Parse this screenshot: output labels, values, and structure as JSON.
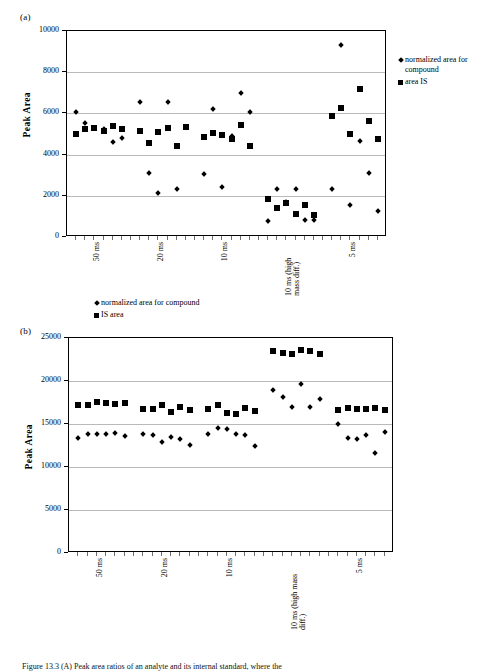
{
  "figure": {
    "caption": "Figure 13.3   (A) Peak area ratios of an analyte and its internal standard, where the"
  },
  "panel_a": {
    "label": "(a)",
    "legend": [
      {
        "marker": "diamond",
        "text": "normalized area for compound"
      },
      {
        "marker": "square",
        "text": "area IS"
      }
    ]
  },
  "panel_b": {
    "label": "(b)",
    "legend": [
      {
        "marker": "diamond",
        "text": "normalized area for compound"
      },
      {
        "marker": "square",
        "text": "IS area"
      }
    ]
  },
  "chart_data": [
    {
      "type": "scatter",
      "panel": "(a)",
      "title": "",
      "xlabel": "",
      "ylabel": "Peak Area",
      "ylim": [
        0,
        10000
      ],
      "yticks": [
        0,
        2000,
        4000,
        6000,
        8000,
        10000
      ],
      "ytick_labels": [
        "0",
        "2000",
        "4000",
        "6000",
        "8000",
        "10000"
      ],
      "grid": true,
      "legend_position": "right",
      "group_labels": [
        "50 ms",
        "20 ms",
        "10 ms",
        "10 ms (high mass diff.)",
        "5 ms"
      ],
      "group_size": 6,
      "x": [
        1,
        2,
        3,
        4,
        5,
        6,
        8,
        9,
        10,
        11,
        12,
        13,
        15,
        16,
        17,
        18,
        19,
        20,
        22,
        23,
        24,
        25,
        26,
        27,
        29,
        30,
        31,
        32,
        33,
        34
      ],
      "xlim": [
        0,
        35
      ],
      "series": [
        {
          "name": "normalized area for compound",
          "marker": "diamond",
          "values": [
            6050,
            5550,
            5300,
            5250,
            4630,
            4800,
            6570,
            3120,
            2130,
            6550,
            2320,
            5350,
            3080,
            6230,
            2420,
            4900,
            7000,
            6080,
            790,
            2320,
            1700,
            2320,
            820,
            820,
            2320,
            9300,
            1550,
            4650,
            3090,
            1260
          ]
        },
        {
          "name": "area IS",
          "marker": "square",
          "values": [
            5000,
            5230,
            5270,
            5160,
            5400,
            5220,
            5140,
            4580,
            5080,
            5270,
            4440,
            5350,
            4860,
            5050,
            4960,
            4780,
            5460,
            4430,
            1830,
            1390,
            1640,
            1100,
            1540,
            1090,
            5880,
            6250,
            5000,
            7200,
            5650,
            4760
          ]
        }
      ]
    },
    {
      "type": "scatter",
      "panel": "(b)",
      "title": "",
      "xlabel": "",
      "ylabel": "Peak Area",
      "ylim": [
        0,
        25000
      ],
      "yticks": [
        0,
        5000,
        10000,
        15000,
        20000,
        25000
      ],
      "ytick_labels": [
        "0",
        "5000",
        "10000",
        "15000",
        "20000",
        "25000"
      ],
      "grid": true,
      "legend_position": "top",
      "group_labels": [
        "50 ms",
        "20 ms",
        "10 ms",
        "10 ms (high mass diff.)",
        "5 ms"
      ],
      "group_size": 6,
      "x": [
        1,
        2,
        3,
        4,
        5,
        6,
        8,
        9,
        10,
        11,
        12,
        13,
        15,
        16,
        17,
        18,
        19,
        20,
        22,
        23,
        24,
        25,
        26,
        27,
        29,
        30,
        31,
        32,
        33,
        34
      ],
      "xlim": [
        0,
        35
      ],
      "series": [
        {
          "name": "normalized area for compound",
          "marker": "diamond",
          "values": [
            13400,
            13850,
            13820,
            13880,
            13900,
            13600,
            13850,
            13720,
            12900,
            13450,
            13300,
            12600,
            13800,
            14500,
            14430,
            13850,
            13700,
            12450,
            18900,
            18100,
            17000,
            19700,
            17000,
            17900,
            14950,
            13400,
            13250,
            13750,
            11650,
            14050
          ]
        },
        {
          "name": "IS area",
          "marker": "square",
          "values": [
            17250,
            17200,
            17550,
            17400,
            17380,
            17500,
            16700,
            16780,
            17200,
            16350,
            17000,
            16650,
            16750,
            17200,
            16300,
            16150,
            16900,
            16500,
            23450,
            23300,
            23150,
            23550,
            23450,
            23150,
            16650,
            16850,
            16800,
            16750,
            16850,
            16600
          ]
        }
      ]
    }
  ]
}
